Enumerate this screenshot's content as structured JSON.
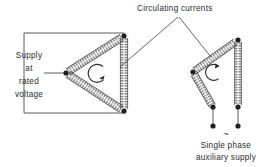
{
  "figure": {
    "annotations": {
      "circulating_currents": "Circulating  currents",
      "supply_line_1": "Supply",
      "supply_line_2": "at",
      "supply_line_3": "rated",
      "supply_line_4": "voltage",
      "aux_supply_line_1": "Single  phase",
      "aux_supply_line_2": "auxiliary supply",
      "ac_symbol": "~"
    },
    "colors": {
      "ink": "#2b2b2b",
      "line": "#4a4a4a",
      "winding": "#555555",
      "background": "#ffffff"
    },
    "left_circuit": {
      "name": "closed-delta-winding",
      "description": "Closed delta with three windings fed from three-phase supply at rated voltage",
      "nodes": [
        {
          "id": "apex-left",
          "x": 66,
          "y": 73
        },
        {
          "id": "node-top-right",
          "x": 124,
          "y": 36
        },
        {
          "id": "node-bottom-right",
          "x": 124,
          "y": 111
        }
      ],
      "windings": [
        {
          "from": "apex-left",
          "to": "node-top-right"
        },
        {
          "from": "node-bottom-right",
          "to": "apex-left"
        },
        {
          "from": "node-top-right",
          "to": "node-bottom-right"
        }
      ],
      "supply_leads": [
        {
          "from_x": 24,
          "from_y": 33,
          "to_x": 124,
          "to_y": 33
        },
        {
          "from_x": 44,
          "from_y": 73,
          "to_x": 66,
          "to_y": 73
        },
        {
          "from_x": 24,
          "from_y": 113,
          "to_x": 124,
          "to_y": 113
        }
      ],
      "circulation_arrow": {
        "cx": 99,
        "cy": 73,
        "r": 9,
        "direction": "clockwise"
      }
    },
    "right_circuit": {
      "name": "open-delta-winding",
      "description": "Open delta energised from single phase auxiliary supply",
      "nodes": [
        {
          "id": "apex-left",
          "x": 193,
          "y": 72
        },
        {
          "id": "node-top-right",
          "x": 238,
          "y": 40
        },
        {
          "id": "terminal-left",
          "x": 213,
          "y": 107
        },
        {
          "id": "terminal-right",
          "x": 238,
          "y": 107
        }
      ],
      "windings": [
        {
          "from": "apex-left",
          "to": "node-top-right"
        },
        {
          "from": "apex-left",
          "to": "terminal-left"
        },
        {
          "from": "node-top-right",
          "to": "terminal-right"
        }
      ],
      "supply_leads": [
        {
          "from_x": 213,
          "from_y": 107,
          "to_x": 213,
          "to_y": 126
        },
        {
          "from_x": 238,
          "from_y": 107,
          "to_x": 238,
          "to_y": 126
        }
      ],
      "circulation_arrow": {
        "cx": 215,
        "cy": 72,
        "r": 8,
        "direction": "clockwise"
      }
    },
    "leader_lines": [
      {
        "name": "leader-to-left-circuit",
        "x1": 178,
        "y1": 17,
        "x2": 120,
        "y2": 67
      },
      {
        "name": "leader-to-right-circuit",
        "x1": 179,
        "y1": 17,
        "x2": 210,
        "y2": 55
      }
    ]
  }
}
